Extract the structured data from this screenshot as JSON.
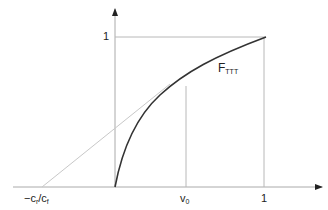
{
  "diagram": {
    "type": "function-plot",
    "x_axis": {
      "labels": {
        "neg_ratio": {
          "main1": "−c",
          "sub1": "r",
          "slash": "/c",
          "sub2": "f"
        },
        "v0": {
          "main": "v",
          "sub": "0"
        },
        "one": "1"
      }
    },
    "y_axis": {
      "labels": {
        "one": "1"
      }
    },
    "curve": {
      "label_main": "F",
      "label_sub": "TTT"
    },
    "colors": {
      "curve": "#333333",
      "axes": "#aaaaaa",
      "guides": "#b8b8b8",
      "tangent": "#c8c8c8"
    }
  }
}
